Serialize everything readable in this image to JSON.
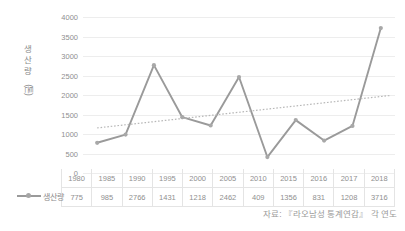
{
  "chart_data": {
    "type": "line",
    "title": "",
    "xlabel": "",
    "ylabel": "생산량 (톤)",
    "ylim": [
      0,
      4000
    ],
    "ytick_step": 500,
    "yticks": [
      "4000",
      "3500",
      "3000",
      "2500",
      "2000",
      "1500",
      "1000",
      "500",
      "0"
    ],
    "grid": true,
    "legend_position": "bottom-left",
    "categories": [
      "1980",
      "1985",
      "1990",
      "1995",
      "2000",
      "2005",
      "2010",
      "2015",
      "2016",
      "2017",
      "2018"
    ],
    "series": [
      {
        "name": "생산량",
        "values": [
          775,
          985,
          2766,
          1431,
          1218,
          2462,
          409,
          1356,
          831,
          1208,
          3716
        ],
        "color": "#9a9a9a",
        "marker": "circle"
      }
    ],
    "trendline": {
      "name": "추세선",
      "type": "linear-dotted",
      "start_value": 1155,
      "end_value": 1990,
      "color": "#b8b8b8",
      "style": "dotted"
    },
    "annotations": [
      "자료: 『라오남성 통계연감』 각 연도"
    ]
  },
  "axis": {
    "y_title_chars": [
      "생",
      "산",
      "량"
    ],
    "y_title_unit": "(톤)"
  },
  "legend": {
    "label": "생산량",
    "marker_icon": "line-marker-icon"
  },
  "table": {
    "years": [
      "1980",
      "1985",
      "1990",
      "1995",
      "2000",
      "2005",
      "2010",
      "2015",
      "2016",
      "2017",
      "2018"
    ],
    "values": [
      "775",
      "985",
      "2766",
      "1431",
      "1218",
      "2462",
      "409",
      "1356",
      "831",
      "1208",
      "3716"
    ]
  },
  "source": {
    "text": "자료: 『라오남성 통계연감』 각 연도"
  },
  "colors": {
    "series": "#9a9a9a",
    "trendline": "#b8b8b8",
    "grid": "#ededed",
    "text": "#8f8f8f",
    "table_border": "#e4e4e4",
    "background": "#ffffff"
  }
}
